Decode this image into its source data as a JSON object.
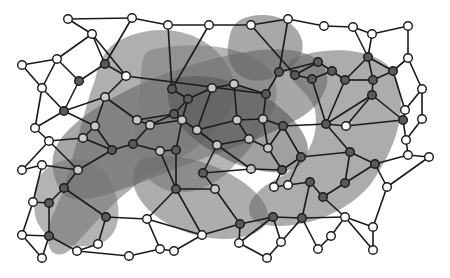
{
  "diagram": {
    "title": "",
    "node_fill_colors": {
      "white": "#ffffff",
      "light": "#c8c8c8",
      "dark": "#5a5a5a"
    },
    "blob_colors": [
      "#6e6e6e",
      "#5e5e5e",
      "#7a7a7a",
      "#525252",
      "#686868",
      "#747474",
      "#606060",
      "#6a6a6a"
    ],
    "blob_opacity": 0.55,
    "nodes": [
      {
        "id": 0,
        "x": 22,
        "y": 65,
        "fill": "white"
      },
      {
        "id": 1,
        "x": 57,
        "y": 59,
        "fill": "white"
      },
      {
        "id": 2,
        "x": 92,
        "y": 34,
        "fill": "white"
      },
      {
        "id": 3,
        "x": 132,
        "y": 18,
        "fill": "white"
      },
      {
        "id": 4,
        "x": 168,
        "y": 25,
        "fill": "white"
      },
      {
        "id": 5,
        "x": 209,
        "y": 25,
        "fill": "white"
      },
      {
        "id": 6,
        "x": 251,
        "y": 25,
        "fill": "white"
      },
      {
        "id": 7,
        "x": 288,
        "y": 19,
        "fill": "white"
      },
      {
        "id": 8,
        "x": 324,
        "y": 26,
        "fill": "white"
      },
      {
        "id": 9,
        "x": 353,
        "y": 27,
        "fill": "white"
      },
      {
        "id": 10,
        "x": 372,
        "y": 34,
        "fill": "white"
      },
      {
        "id": 11,
        "x": 408,
        "y": 26,
        "fill": "white"
      },
      {
        "id": 12,
        "x": 408,
        "y": 58,
        "fill": "white"
      },
      {
        "id": 13,
        "x": 422,
        "y": 89,
        "fill": "white"
      },
      {
        "id": 14,
        "x": 405,
        "y": 110,
        "fill": "white"
      },
      {
        "id": 15,
        "x": 422,
        "y": 119,
        "fill": "white"
      },
      {
        "id": 16,
        "x": 126,
        "y": 76,
        "fill": "white"
      },
      {
        "id": 17,
        "x": 42,
        "y": 88,
        "fill": "white"
      },
      {
        "id": 18,
        "x": 105,
        "y": 97,
        "fill": "light"
      },
      {
        "id": 19,
        "x": 35,
        "y": 128,
        "fill": "white"
      },
      {
        "id": 20,
        "x": 49,
        "y": 141,
        "fill": "white"
      },
      {
        "id": 21,
        "x": 22,
        "y": 170,
        "fill": "white"
      },
      {
        "id": 22,
        "x": 42,
        "y": 165,
        "fill": "white"
      },
      {
        "id": 23,
        "x": 33,
        "y": 202,
        "fill": "white"
      },
      {
        "id": 24,
        "x": 22,
        "y": 235,
        "fill": "white"
      },
      {
        "id": 25,
        "x": 42,
        "y": 258,
        "fill": "white"
      },
      {
        "id": 26,
        "x": 77,
        "y": 251,
        "fill": "white"
      },
      {
        "id": 27,
        "x": 98,
        "y": 244,
        "fill": "white"
      },
      {
        "id": 28,
        "x": 129,
        "y": 256,
        "fill": "white"
      },
      {
        "id": 29,
        "x": 147,
        "y": 219,
        "fill": "white"
      },
      {
        "id": 30,
        "x": 160,
        "y": 249,
        "fill": "white"
      },
      {
        "id": 31,
        "x": 174,
        "y": 251,
        "fill": "white"
      },
      {
        "id": 32,
        "x": 202,
        "y": 235,
        "fill": "white"
      },
      {
        "id": 33,
        "x": 239,
        "y": 243,
        "fill": "white"
      },
      {
        "id": 34,
        "x": 267,
        "y": 258,
        "fill": "white"
      },
      {
        "id": 35,
        "x": 281,
        "y": 242,
        "fill": "white"
      },
      {
        "id": 36,
        "x": 318,
        "y": 249,
        "fill": "white"
      },
      {
        "id": 37,
        "x": 331,
        "y": 236,
        "fill": "white"
      },
      {
        "id": 38,
        "x": 345,
        "y": 217,
        "fill": "white"
      },
      {
        "id": 39,
        "x": 373,
        "y": 227,
        "fill": "white"
      },
      {
        "id": 40,
        "x": 373,
        "y": 250,
        "fill": "white"
      },
      {
        "id": 41,
        "x": 408,
        "y": 155,
        "fill": "white"
      },
      {
        "id": 42,
        "x": 429,
        "y": 157,
        "fill": "white"
      },
      {
        "id": 43,
        "x": 387,
        "y": 187,
        "fill": "white"
      },
      {
        "id": 44,
        "x": 346,
        "y": 126,
        "fill": "white"
      },
      {
        "id": 45,
        "x": 274,
        "y": 187,
        "fill": "white"
      },
      {
        "id": 46,
        "x": 288,
        "y": 185,
        "fill": "white"
      },
      {
        "id": 47,
        "x": 406,
        "y": 140,
        "fill": "white"
      },
      {
        "id": 48,
        "x": 68,
        "y": 19,
        "fill": "white"
      },
      {
        "id": 49,
        "x": 105,
        "y": 64,
        "fill": "dark"
      },
      {
        "id": 50,
        "x": 79,
        "y": 81,
        "fill": "dark"
      },
      {
        "id": 51,
        "x": 64,
        "y": 111,
        "fill": "dark"
      },
      {
        "id": 52,
        "x": 95,
        "y": 126,
        "fill": "light"
      },
      {
        "id": 53,
        "x": 83,
        "y": 138,
        "fill": "light"
      },
      {
        "id": 54,
        "x": 112,
        "y": 150,
        "fill": "dark"
      },
      {
        "id": 55,
        "x": 78,
        "y": 170,
        "fill": "light"
      },
      {
        "id": 56,
        "x": 64,
        "y": 188,
        "fill": "dark"
      },
      {
        "id": 57,
        "x": 49,
        "y": 203,
        "fill": "dark"
      },
      {
        "id": 58,
        "x": 49,
        "y": 236,
        "fill": "dark"
      },
      {
        "id": 59,
        "x": 106,
        "y": 217,
        "fill": "dark"
      },
      {
        "id": 60,
        "x": 133,
        "y": 144,
        "fill": "dark"
      },
      {
        "id": 61,
        "x": 137,
        "y": 120,
        "fill": "light"
      },
      {
        "id": 62,
        "x": 174,
        "y": 114,
        "fill": "dark"
      },
      {
        "id": 63,
        "x": 150,
        "y": 125,
        "fill": "light"
      },
      {
        "id": 64,
        "x": 160,
        "y": 151,
        "fill": "light"
      },
      {
        "id": 65,
        "x": 176,
        "y": 150,
        "fill": "dark"
      },
      {
        "id": 66,
        "x": 188,
        "y": 99,
        "fill": "dark"
      },
      {
        "id": 67,
        "x": 182,
        "y": 120,
        "fill": "light"
      },
      {
        "id": 68,
        "x": 172,
        "y": 89,
        "fill": "dark"
      },
      {
        "id": 69,
        "x": 197,
        "y": 130,
        "fill": "light"
      },
      {
        "id": 70,
        "x": 212,
        "y": 88,
        "fill": "light"
      },
      {
        "id": 71,
        "x": 217,
        "y": 145,
        "fill": "light"
      },
      {
        "id": 72,
        "x": 237,
        "y": 120,
        "fill": "light"
      },
      {
        "id": 73,
        "x": 263,
        "y": 119,
        "fill": "light"
      },
      {
        "id": 74,
        "x": 266,
        "y": 94,
        "fill": "dark"
      },
      {
        "id": 75,
        "x": 251,
        "y": 169,
        "fill": "light"
      },
      {
        "id": 76,
        "x": 249,
        "y": 139,
        "fill": "light"
      },
      {
        "id": 77,
        "x": 268,
        "y": 148,
        "fill": "light"
      },
      {
        "id": 78,
        "x": 283,
        "y": 126,
        "fill": "dark"
      },
      {
        "id": 79,
        "x": 279,
        "y": 72,
        "fill": "dark"
      },
      {
        "id": 80,
        "x": 295,
        "y": 75,
        "fill": "dark"
      },
      {
        "id": 81,
        "x": 312,
        "y": 79,
        "fill": "dark"
      },
      {
        "id": 82,
        "x": 318,
        "y": 62,
        "fill": "dark"
      },
      {
        "id": 83,
        "x": 332,
        "y": 71,
        "fill": "dark"
      },
      {
        "id": 84,
        "x": 345,
        "y": 80,
        "fill": "dark"
      },
      {
        "id": 85,
        "x": 368,
        "y": 57,
        "fill": "dark"
      },
      {
        "id": 86,
        "x": 372,
        "y": 95,
        "fill": "dark"
      },
      {
        "id": 87,
        "x": 393,
        "y": 71,
        "fill": "dark"
      },
      {
        "id": 88,
        "x": 373,
        "y": 80,
        "fill": "dark"
      },
      {
        "id": 89,
        "x": 375,
        "y": 164,
        "fill": "dark"
      },
      {
        "id": 90,
        "x": 350,
        "y": 152,
        "fill": "dark"
      },
      {
        "id": 91,
        "x": 323,
        "y": 197,
        "fill": "dark"
      },
      {
        "id": 92,
        "x": 302,
        "y": 218,
        "fill": "dark"
      },
      {
        "id": 93,
        "x": 273,
        "y": 217,
        "fill": "dark"
      },
      {
        "id": 94,
        "x": 240,
        "y": 224,
        "fill": "dark"
      },
      {
        "id": 95,
        "x": 301,
        "y": 157,
        "fill": "dark"
      },
      {
        "id": 96,
        "x": 326,
        "y": 124,
        "fill": "dark"
      },
      {
        "id": 97,
        "x": 215,
        "y": 189,
        "fill": "light"
      },
      {
        "id": 98,
        "x": 203,
        "y": 173,
        "fill": "dark"
      },
      {
        "id": 99,
        "x": 176,
        "y": 189,
        "fill": "dark"
      },
      {
        "id": 100,
        "x": 345,
        "y": 183,
        "fill": "dark"
      },
      {
        "id": 101,
        "x": 310,
        "y": 182,
        "fill": "dark"
      },
      {
        "id": 102,
        "x": 282,
        "y": 170,
        "fill": "dark"
      },
      {
        "id": 103,
        "x": 403,
        "y": 120,
        "fill": "dark"
      },
      {
        "id": 104,
        "x": 234,
        "y": 84,
        "fill": "light"
      }
    ],
    "edges": [
      [
        48,
        2
      ],
      [
        48,
        3
      ],
      [
        3,
        4
      ],
      [
        4,
        5
      ],
      [
        5,
        6
      ],
      [
        6,
        7
      ],
      [
        7,
        8
      ],
      [
        8,
        9
      ],
      [
        9,
        10
      ],
      [
        10,
        11
      ],
      [
        11,
        12
      ],
      [
        12,
        13
      ],
      [
        13,
        15
      ],
      [
        12,
        87
      ],
      [
        10,
        85
      ],
      [
        9,
        85
      ],
      [
        85,
        87
      ],
      [
        87,
        12
      ],
      [
        87,
        14
      ],
      [
        87,
        88
      ],
      [
        88,
        86
      ],
      [
        85,
        88
      ],
      [
        84,
        88
      ],
      [
        84,
        85
      ],
      [
        82,
        83
      ],
      [
        83,
        84
      ],
      [
        82,
        79
      ],
      [
        82,
        80
      ],
      [
        80,
        81
      ],
      [
        81,
        83
      ],
      [
        0,
        1
      ],
      [
        1,
        2
      ],
      [
        0,
        17
      ],
      [
        1,
        17
      ],
      [
        1,
        50
      ],
      [
        2,
        16
      ],
      [
        2,
        49
      ],
      [
        16,
        49
      ],
      [
        16,
        74
      ],
      [
        3,
        49
      ],
      [
        49,
        50
      ],
      [
        50,
        51
      ],
      [
        17,
        51
      ],
      [
        17,
        19
      ],
      [
        19,
        51
      ],
      [
        19,
        20
      ],
      [
        51,
        52
      ],
      [
        51,
        18
      ],
      [
        18,
        16
      ],
      [
        18,
        61
      ],
      [
        18,
        52
      ],
      [
        52,
        53
      ],
      [
        53,
        20
      ],
      [
        53,
        54
      ],
      [
        52,
        54
      ],
      [
        54,
        55
      ],
      [
        20,
        55
      ],
      [
        20,
        21
      ],
      [
        21,
        22
      ],
      [
        22,
        55
      ],
      [
        22,
        23
      ],
      [
        23,
        57
      ],
      [
        55,
        56
      ],
      [
        56,
        57
      ],
      [
        57,
        58
      ],
      [
        23,
        24
      ],
      [
        24,
        58
      ],
      [
        24,
        25
      ],
      [
        25,
        58
      ],
      [
        58,
        26
      ],
      [
        26,
        27
      ],
      [
        27,
        59
      ],
      [
        59,
        56
      ],
      [
        59,
        29
      ],
      [
        26,
        28
      ],
      [
        28,
        30
      ],
      [
        29,
        30
      ],
      [
        30,
        31
      ],
      [
        31,
        32
      ],
      [
        32,
        29
      ],
      [
        32,
        99
      ],
      [
        99,
        29
      ],
      [
        4,
        68
      ],
      [
        5,
        68
      ],
      [
        68,
        66
      ],
      [
        66,
        62
      ],
      [
        62,
        61
      ],
      [
        61,
        63
      ],
      [
        63,
        67
      ],
      [
        66,
        67
      ],
      [
        67,
        69
      ],
      [
        62,
        63
      ],
      [
        60,
        63
      ],
      [
        60,
        54
      ],
      [
        60,
        64
      ],
      [
        64,
        65
      ],
      [
        65,
        67
      ],
      [
        65,
        99
      ],
      [
        64,
        99
      ],
      [
        69,
        71
      ],
      [
        69,
        70
      ],
      [
        70,
        66
      ],
      [
        70,
        104
      ],
      [
        104,
        74
      ],
      [
        104,
        72
      ],
      [
        72,
        73
      ],
      [
        73,
        74
      ],
      [
        72,
        69
      ],
      [
        72,
        76
      ],
      [
        76,
        71
      ],
      [
        76,
        77
      ],
      [
        77,
        73
      ],
      [
        73,
        78
      ],
      [
        78,
        77
      ],
      [
        78,
        95
      ],
      [
        95,
        102
      ],
      [
        102,
        77
      ],
      [
        102,
        75
      ],
      [
        75,
        71
      ],
      [
        75,
        98
      ],
      [
        98,
        97
      ],
      [
        97,
        99
      ],
      [
        98,
        71
      ],
      [
        97,
        94
      ],
      [
        94,
        32
      ],
      [
        94,
        33
      ],
      [
        33,
        34
      ],
      [
        34,
        35
      ],
      [
        35,
        93
      ],
      [
        93,
        94
      ],
      [
        93,
        92
      ],
      [
        92,
        35
      ],
      [
        92,
        36
      ],
      [
        36,
        37
      ],
      [
        37,
        38
      ],
      [
        38,
        92
      ],
      [
        38,
        91
      ],
      [
        91,
        101
      ],
      [
        101,
        92
      ],
      [
        101,
        46
      ],
      [
        46,
        45
      ],
      [
        45,
        102
      ],
      [
        46,
        95
      ],
      [
        91,
        100
      ],
      [
        100,
        89
      ],
      [
        89,
        43
      ],
      [
        43,
        39
      ],
      [
        39,
        40
      ],
      [
        40,
        38
      ],
      [
        39,
        38
      ],
      [
        43,
        42
      ],
      [
        42,
        41
      ],
      [
        41,
        89
      ],
      [
        41,
        47
      ],
      [
        47,
        15
      ],
      [
        47,
        103
      ],
      [
        103,
        86
      ],
      [
        103,
        14
      ],
      [
        14,
        13
      ],
      [
        44,
        86
      ],
      [
        44,
        96
      ],
      [
        96,
        90
      ],
      [
        90,
        89
      ],
      [
        90,
        100
      ],
      [
        96,
        81
      ],
      [
        96,
        78
      ],
      [
        84,
        96
      ],
      [
        74,
        79
      ],
      [
        79,
        7
      ],
      [
        80,
        6
      ],
      [
        95,
        90
      ],
      [
        44,
        103
      ],
      [
        86,
        96
      ],
      [
        33,
        93
      ]
    ],
    "blobs": [
      {
        "id": "blob-a",
        "color_index": 0,
        "path": "M 120 40 C 160 20, 210 30, 230 70 C 250 110, 200 150, 160 170 C 120 190, 90 230, 70 250 C 50 265, 40 240, 55 210 C 70 180, 80 120, 95 80 C 100 60, 105 48, 120 40 Z"
      },
      {
        "id": "blob-b",
        "color_index": 1,
        "path": "M 60 140 C 90 100, 180 60, 260 50 C 320 45, 340 70, 320 100 C 300 130, 220 150, 160 175 C 110 195, 70 210, 60 190 C 50 170, 50 155, 60 140 Z"
      },
      {
        "id": "blob-c",
        "color_index": 2,
        "path": "M 150 50 C 190 40, 250 45, 270 70 C 290 100, 260 140, 230 170 C 205 195, 170 200, 150 180 C 130 160, 135 120, 140 90 C 142 70, 140 55, 150 50 Z"
      },
      {
        "id": "blob-d",
        "color_index": 3,
        "path": "M 170 80 C 200 70, 240 80, 270 100 C 300 120, 320 150, 300 165 C 280 180, 240 170, 210 150 C 185 135, 160 110, 170 80 Z"
      },
      {
        "id": "blob-e",
        "color_index": 4,
        "path": "M 290 60 C 320 45, 380 45, 395 75 C 410 110, 395 150, 370 185 C 345 215, 300 230, 265 225 C 240 220, 245 195, 275 180 C 305 165, 320 140, 315 110 C 310 90, 280 80, 290 60 Z"
      },
      {
        "id": "blob-f",
        "color_index": 5,
        "path": "M 45 170 C 70 150, 100 160, 110 180 C 125 210, 120 240, 95 245 C 70 250, 40 240, 35 215 C 32 195, 35 180, 45 170 Z"
      },
      {
        "id": "blob-g",
        "color_index": 6,
        "path": "M 240 20 C 260 10, 290 15, 300 35 C 310 55, 290 75, 265 80 C 240 85, 225 65, 228 45 C 230 32, 232 25, 240 20 Z"
      },
      {
        "id": "blob-h",
        "color_index": 7,
        "path": "M 140 160 C 170 150, 210 160, 240 180 C 270 200, 280 225, 250 235 C 220 245, 180 235, 155 215 C 135 200, 125 175, 140 160 Z"
      }
    ]
  }
}
